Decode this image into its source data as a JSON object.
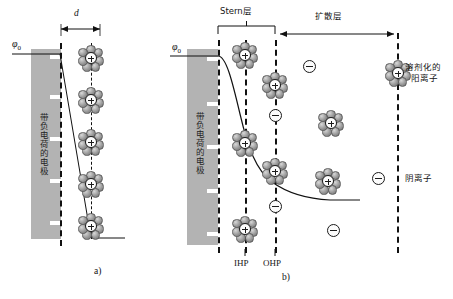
{
  "figure": {
    "kind": "electrical-double-layer-diagram",
    "panels": [
      {
        "id": "a",
        "caption": "a)",
        "model": "Helmholtz",
        "electrode_label": "带负电荷的电极",
        "potential_symbol": "φ0",
        "distance_label": "d",
        "potential_profile": "linear",
        "cation_count": 5
      },
      {
        "id": "b",
        "caption": "b)",
        "model": "Stern / Gouy-Chapman",
        "electrode_label": "带负电荷的电极",
        "potential_symbol": "φ0",
        "potential_profile": "exponential-decay",
        "stern_layer_label": "Stern层",
        "diffuse_layer_label": "扩散层",
        "plane_labels": [
          "IHP",
          "OHP"
        ],
        "legend": [
          {
            "glyph": "solvated-cation",
            "label": "溶剂化的\n阳离子"
          },
          {
            "glyph": "anion",
            "label": "阴离子"
          }
        ],
        "cation_count": 7,
        "anion_count": 5
      }
    ],
    "colors": {
      "electrode_fill": "#b3b3b3",
      "charge_mark": "#ffffff",
      "line": "#111111",
      "sphere_dark": "#6e6e6e",
      "sphere_light": "#d8d8d8",
      "background": "#ffffff"
    },
    "legend_lines": {
      "solvated_cation_line1": "溶剂化的",
      "solvated_cation_line2": "阳离子",
      "anion": "阴离子"
    }
  }
}
